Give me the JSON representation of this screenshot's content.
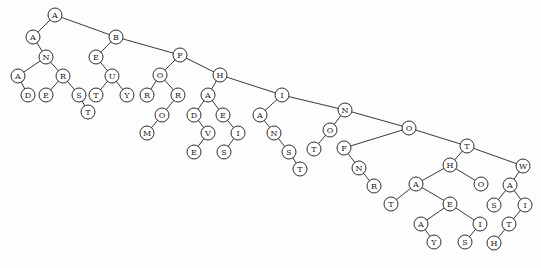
{
  "diagram": {
    "type": "binary-search-tree",
    "node_radius": 7,
    "nodes": [
      {
        "id": "n0",
        "label": "A",
        "x": 55,
        "y": 15
      },
      {
        "id": "n1",
        "label": "A",
        "x": 33,
        "y": 37
      },
      {
        "id": "n2",
        "label": "N",
        "x": 46,
        "y": 57
      },
      {
        "id": "n3",
        "label": "A",
        "x": 18,
        "y": 76
      },
      {
        "id": "n4",
        "label": "D",
        "x": 28,
        "y": 95
      },
      {
        "id": "n5",
        "label": "R",
        "x": 63,
        "y": 76
      },
      {
        "id": "n6",
        "label": "E",
        "x": 46,
        "y": 95
      },
      {
        "id": "n7",
        "label": "S",
        "x": 79,
        "y": 95
      },
      {
        "id": "n8",
        "label": "T",
        "x": 88,
        "y": 112
      },
      {
        "id": "n9",
        "label": "B",
        "x": 116,
        "y": 37
      },
      {
        "id": "n10",
        "label": "E",
        "x": 96,
        "y": 57
      },
      {
        "id": "n11",
        "label": "U",
        "x": 112,
        "y": 76
      },
      {
        "id": "n12",
        "label": "T",
        "x": 96,
        "y": 95
      },
      {
        "id": "n13",
        "label": "Y",
        "x": 127,
        "y": 95
      },
      {
        "id": "n14",
        "label": "F",
        "x": 180,
        "y": 55
      },
      {
        "id": "n15",
        "label": "O",
        "x": 160,
        "y": 75
      },
      {
        "id": "n16",
        "label": "R",
        "x": 147,
        "y": 95
      },
      {
        "id": "n17",
        "label": "R",
        "x": 178,
        "y": 95
      },
      {
        "id": "n18",
        "label": "O",
        "x": 162,
        "y": 115
      },
      {
        "id": "n19",
        "label": "M",
        "x": 147,
        "y": 133
      },
      {
        "id": "n20",
        "label": "H",
        "x": 220,
        "y": 75
      },
      {
        "id": "n21",
        "label": "A",
        "x": 208,
        "y": 95
      },
      {
        "id": "n22",
        "label": "D",
        "x": 194,
        "y": 115
      },
      {
        "id": "n23",
        "label": "V",
        "x": 208,
        "y": 133
      },
      {
        "id": "n24",
        "label": "E",
        "x": 194,
        "y": 152
      },
      {
        "id": "n25",
        "label": "E",
        "x": 223,
        "y": 115
      },
      {
        "id": "n26",
        "label": "I",
        "x": 238,
        "y": 133
      },
      {
        "id": "n27",
        "label": "S",
        "x": 224,
        "y": 152
      },
      {
        "id": "n28",
        "label": "I",
        "x": 282,
        "y": 95
      },
      {
        "id": "n29",
        "label": "A",
        "x": 260,
        "y": 115
      },
      {
        "id": "n30",
        "label": "N",
        "x": 274,
        "y": 133
      },
      {
        "id": "n31",
        "label": "S",
        "x": 289,
        "y": 152
      },
      {
        "id": "n32",
        "label": "T",
        "x": 300,
        "y": 169
      },
      {
        "id": "n33",
        "label": "N",
        "x": 345,
        "y": 110
      },
      {
        "id": "n34",
        "label": "O",
        "x": 330,
        "y": 130
      },
      {
        "id": "n35",
        "label": "T",
        "x": 314,
        "y": 149
      },
      {
        "id": "n36",
        "label": "O",
        "x": 409,
        "y": 128
      },
      {
        "id": "n37",
        "label": "F",
        "x": 344,
        "y": 148
      },
      {
        "id": "n38",
        "label": "N",
        "x": 359,
        "y": 168
      },
      {
        "id": "n39",
        "label": "R",
        "x": 374,
        "y": 186
      },
      {
        "id": "n40",
        "label": "T",
        "x": 467,
        "y": 146
      },
      {
        "id": "n41",
        "label": "H",
        "x": 450,
        "y": 165
      },
      {
        "id": "n42",
        "label": "O",
        "x": 481,
        "y": 184
      },
      {
        "id": "n43",
        "label": "A",
        "x": 416,
        "y": 184
      },
      {
        "id": "n44",
        "label": "T",
        "x": 391,
        "y": 204
      },
      {
        "id": "n45",
        "label": "E",
        "x": 450,
        "y": 204
      },
      {
        "id": "n46",
        "label": "A",
        "x": 421,
        "y": 224
      },
      {
        "id": "n47",
        "label": "Y",
        "x": 434,
        "y": 242
      },
      {
        "id": "n48",
        "label": "I",
        "x": 480,
        "y": 224
      },
      {
        "id": "n49",
        "label": "S",
        "x": 465,
        "y": 242
      },
      {
        "id": "n50",
        "label": "W",
        "x": 523,
        "y": 166
      },
      {
        "id": "n51",
        "label": "A",
        "x": 510,
        "y": 185
      },
      {
        "id": "n52",
        "label": "S",
        "x": 494,
        "y": 205
      },
      {
        "id": "n53",
        "label": "I",
        "x": 525,
        "y": 205
      },
      {
        "id": "n54",
        "label": "T",
        "x": 509,
        "y": 224
      },
      {
        "id": "n55",
        "label": "H",
        "x": 494,
        "y": 243
      }
    ],
    "edges": [
      [
        "n0",
        "n1"
      ],
      [
        "n0",
        "n9"
      ],
      [
        "n1",
        "n2"
      ],
      [
        "n2",
        "n3"
      ],
      [
        "n3",
        "n4"
      ],
      [
        "n2",
        "n5"
      ],
      [
        "n5",
        "n6"
      ],
      [
        "n5",
        "n7"
      ],
      [
        "n7",
        "n8"
      ],
      [
        "n9",
        "n10"
      ],
      [
        "n10",
        "n11"
      ],
      [
        "n11",
        "n12"
      ],
      [
        "n11",
        "n13"
      ],
      [
        "n9",
        "n14"
      ],
      [
        "n14",
        "n15"
      ],
      [
        "n15",
        "n16"
      ],
      [
        "n15",
        "n17"
      ],
      [
        "n17",
        "n18"
      ],
      [
        "n18",
        "n19"
      ],
      [
        "n14",
        "n20"
      ],
      [
        "n20",
        "n21"
      ],
      [
        "n21",
        "n22"
      ],
      [
        "n22",
        "n23"
      ],
      [
        "n23",
        "n24"
      ],
      [
        "n21",
        "n25"
      ],
      [
        "n25",
        "n26"
      ],
      [
        "n26",
        "n27"
      ],
      [
        "n20",
        "n28"
      ],
      [
        "n28",
        "n29"
      ],
      [
        "n29",
        "n30"
      ],
      [
        "n30",
        "n31"
      ],
      [
        "n31",
        "n32"
      ],
      [
        "n28",
        "n33"
      ],
      [
        "n33",
        "n34"
      ],
      [
        "n34",
        "n35"
      ],
      [
        "n33",
        "n36"
      ],
      [
        "n36",
        "n37"
      ],
      [
        "n37",
        "n38"
      ],
      [
        "n38",
        "n39"
      ],
      [
        "n36",
        "n40"
      ],
      [
        "n40",
        "n41"
      ],
      [
        "n41",
        "n43"
      ],
      [
        "n43",
        "n44"
      ],
      [
        "n43",
        "n45"
      ],
      [
        "n45",
        "n46"
      ],
      [
        "n46",
        "n47"
      ],
      [
        "n45",
        "n48"
      ],
      [
        "n48",
        "n49"
      ],
      [
        "n41",
        "n42"
      ],
      [
        "n40",
        "n50"
      ],
      [
        "n50",
        "n51"
      ],
      [
        "n51",
        "n52"
      ],
      [
        "n51",
        "n53"
      ],
      [
        "n53",
        "n54"
      ],
      [
        "n54",
        "n55"
      ]
    ]
  }
}
